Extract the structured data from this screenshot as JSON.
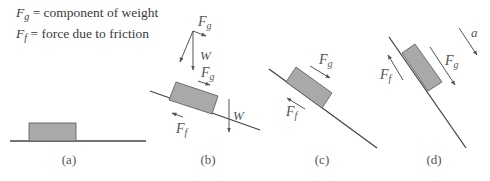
{
  "legend": {
    "items": [
      {
        "symbol": "F",
        "subscript": "g",
        "text": " = component of weight"
      },
      {
        "symbol": "F",
        "subscript": "f",
        "text": " = force due to friction"
      }
    ]
  },
  "panels": [
    {
      "id": "a",
      "caption": "(a)",
      "description": "block resting on horizontal surface"
    },
    {
      "id": "b",
      "caption": "(b)",
      "description": "block on shallow incline with weight W resolved into Fg",
      "labels": {
        "fg_top": "F",
        "fg_top_sub": "g",
        "w_top": "W",
        "fg_mid": "F",
        "fg_mid_sub": "g",
        "w_right": "W",
        "ff": "F",
        "ff_sub": "f"
      }
    },
    {
      "id": "c",
      "caption": "(c)",
      "description": "block on steeper incline",
      "labels": {
        "fg": "F",
        "fg_sub": "g",
        "ff": "F",
        "ff_sub": "f"
      }
    },
    {
      "id": "d",
      "caption": "(d)",
      "description": "block on steep incline accelerating",
      "labels": {
        "fg": "F",
        "fg_sub": "g",
        "ff": "F",
        "ff_sub": "f",
        "a": "a"
      }
    }
  ],
  "colors": {
    "block_fill": "#a9a9a9",
    "block_stroke": "#555555",
    "line": "#444444",
    "arrow": "#555555"
  }
}
